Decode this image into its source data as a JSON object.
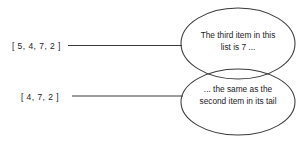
{
  "diagram": {
    "stroke_color": "#3a3a3a",
    "text_color": "#1b1b1b",
    "background_color": "#ffffff",
    "labels": [
      {
        "id": "source-list",
        "text": "[ 5, 4, 7, 2 ]"
      },
      {
        "id": "tail-list",
        "text": "[ 4, 7, 2 ]"
      }
    ],
    "bubbles": [
      {
        "id": "top-bubble",
        "lines": [
          "The third item in this",
          "list is 7 ..."
        ]
      },
      {
        "id": "bottom-bubble",
        "lines": [
          "... the same as the",
          "second item in its tail"
        ]
      }
    ],
    "connectors": [
      {
        "id": "connector-top",
        "from_label": "source-list",
        "to_bubble": "top-bubble"
      },
      {
        "id": "connector-bottom",
        "from_label": "tail-list",
        "to_bubble": "bottom-bubble"
      }
    ]
  }
}
